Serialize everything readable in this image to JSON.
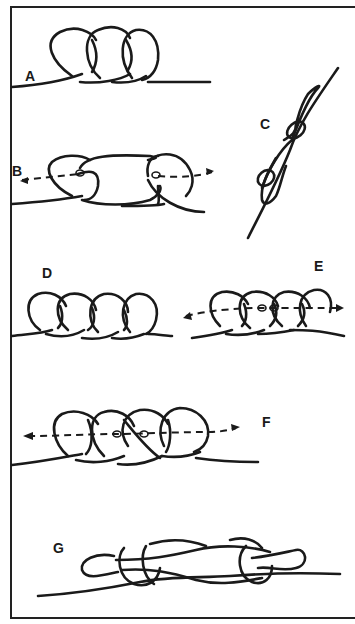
{
  "figure": {
    "panels": [
      {
        "id": "A",
        "label": "A"
      },
      {
        "id": "B",
        "label": "B"
      },
      {
        "id": "C",
        "label": "C"
      },
      {
        "id": "D",
        "label": "D"
      },
      {
        "id": "E",
        "label": "E"
      },
      {
        "id": "F",
        "label": "F"
      },
      {
        "id": "G",
        "label": "G"
      }
    ],
    "colors": {
      "line": "#1a1a1a",
      "background": "#ffffff"
    }
  }
}
